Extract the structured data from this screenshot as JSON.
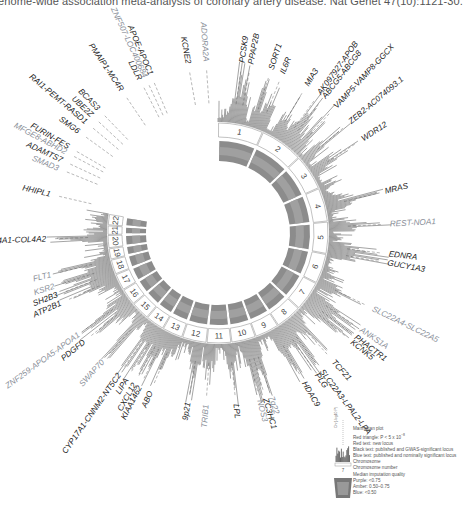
{
  "caption": "enome-wide association meta-analysis of coronary artery disease. Nat Genet 47(10):1121-30.",
  "colors": {
    "black_text": "#222222",
    "blue_text": "#8a8f99",
    "red_text": "#9a9a9a",
    "ring_gray": "#8c8c8c",
    "ring_inner": "#a0a0a0",
    "manhattan": "#333333"
  },
  "chart_data": {
    "type": "circular_manhattan",
    "center": [
      218,
      233
    ],
    "chromosomes": [
      "1",
      "2",
      "3",
      "4",
      "5",
      "6",
      "7",
      "8",
      "9",
      "10",
      "11",
      "12",
      "13",
      "14",
      "15",
      "16",
      "17",
      "18",
      "19",
      "20",
      "21",
      "22"
    ],
    "chromosome_spans_deg": [
      [
        0,
        24
      ],
      [
        24,
        47
      ],
      [
        47,
        66
      ],
      [
        66,
        84
      ],
      [
        84,
        101
      ],
      [
        101,
        117
      ],
      [
        117,
        133
      ],
      [
        133,
        147
      ],
      [
        147,
        160
      ],
      [
        160,
        173
      ],
      [
        173,
        186
      ],
      [
        186,
        199
      ],
      [
        199,
        210
      ],
      [
        210,
        220
      ],
      [
        220,
        230
      ],
      [
        230,
        239
      ],
      [
        239,
        248
      ],
      [
        248,
        256
      ],
      [
        256,
        262
      ],
      [
        262,
        269
      ],
      [
        269,
        274
      ],
      [
        274,
        280
      ]
    ],
    "loci": [
      {
        "label": "PCSK9",
        "angle": 8,
        "style": "black"
      },
      {
        "label": "PPAP2B",
        "angle": 11,
        "style": "black"
      },
      {
        "label": "SORT1",
        "angle": 18,
        "style": "black"
      },
      {
        "label": "IL6R",
        "angle": 22,
        "style": "black"
      },
      {
        "label": "MIA3",
        "angle": 31,
        "style": "black"
      },
      {
        "label": "AK097927-APOB",
        "angle": 36,
        "style": "black"
      },
      {
        "label": "ABCG5-ABCG8",
        "angle": 38,
        "style": "black"
      },
      {
        "label": "VAMP5-VAMP8-GGCX",
        "angle": 43,
        "style": "black"
      },
      {
        "label": "ZEB2-AC074093.1",
        "angle": 50,
        "style": "black"
      },
      {
        "label": "WDR12",
        "angle": 57,
        "style": "black"
      },
      {
        "label": "MRAS",
        "angle": 76,
        "style": "black"
      },
      {
        "label": "REST-NOA1",
        "angle": 87,
        "style": "blue"
      },
      {
        "label": "EDNRA",
        "angle": 97,
        "style": "black"
      },
      {
        "label": "GUCY1A3",
        "angle": 100,
        "style": "black"
      },
      {
        "label": "SLC22A4-SLC22A5",
        "angle": 116,
        "style": "blue"
      },
      {
        "label": "ANKS1A",
        "angle": 124,
        "style": "blue"
      },
      {
        "label": "PHACTR1",
        "angle": 127,
        "style": "black"
      },
      {
        "label": "KCNK5",
        "angle": 129,
        "style": "black"
      },
      {
        "label": "TCF21",
        "angle": 138,
        "style": "black"
      },
      {
        "label": "SLC22A3-LPAL2-LPA",
        "angle": 143,
        "style": "black"
      },
      {
        "label": "PLG",
        "angle": 145,
        "style": "black"
      },
      {
        "label": "HDAC9",
        "angle": 150,
        "style": "black"
      },
      {
        "label": "7q22",
        "angle": 162,
        "style": "blue"
      },
      {
        "label": "ZC3HC1",
        "angle": 164,
        "style": "black"
      },
      {
        "label": "NOS3",
        "angle": 166,
        "style": "blue"
      },
      {
        "label": "LPL",
        "angle": 174,
        "style": "black"
      },
      {
        "label": "TRIB1",
        "angle": 184,
        "style": "blue"
      },
      {
        "label": "9p21",
        "angle": 190,
        "style": "black"
      },
      {
        "label": "ABO",
        "angle": 203,
        "style": "black"
      },
      {
        "label": "KIAA1462",
        "angle": 207,
        "style": "black"
      },
      {
        "label": "CXCL12",
        "angle": 209,
        "style": "black"
      },
      {
        "label": "LIPA",
        "angle": 212,
        "style": "black"
      },
      {
        "label": "CYP17A1-CNNM2-NT5C2",
        "angle": 215,
        "style": "black"
      },
      {
        "label": "SWAP70",
        "angle": 222,
        "style": "blue"
      },
      {
        "label": "PDGFD",
        "angle": 231,
        "style": "black"
      },
      {
        "label": "ZNF259-APOA5-APOA1",
        "angle": 234,
        "style": "blue"
      },
      {
        "label": "ATP2B1",
        "angle": 246,
        "style": "black"
      },
      {
        "label": "SH2B3",
        "angle": 249,
        "style": "black"
      },
      {
        "label": "KSR2",
        "angle": 252,
        "style": "blue"
      },
      {
        "label": "FLT1",
        "angle": 256,
        "style": "blue"
      },
      {
        "label": "COL4A1-COL4A2",
        "angle": 268,
        "style": "black"
      },
      {
        "label": "HHIPL1",
        "angle": 283,
        "style": "black"
      },
      {
        "label": "SMAD3",
        "angle": 292,
        "style": "blue"
      },
      {
        "label": "ADAMTS7",
        "angle": 295,
        "style": "black"
      },
      {
        "label": "MFGE8-ABHD2",
        "angle": 298,
        "style": "blue"
      },
      {
        "label": "FURIN-FES",
        "angle": 300,
        "style": "black"
      },
      {
        "label": "SMG6",
        "angle": 306,
        "style": "black"
      },
      {
        "label": "RAI1-PEMT-RASD1",
        "angle": 310,
        "style": "black"
      },
      {
        "label": "UBE2Z",
        "angle": 313,
        "style": "black"
      },
      {
        "label": "BCAS3",
        "angle": 316,
        "style": "black"
      },
      {
        "label": "PMAIP1-MC4R",
        "angle": 326,
        "style": "black"
      },
      {
        "label": "LDLR",
        "angle": 333,
        "style": "black"
      },
      {
        "label": "ZNF507-LOC400684",
        "angle": 335,
        "style": "blue"
      },
      {
        "label": "APOE-APOC1",
        "angle": 337,
        "style": "black"
      },
      {
        "label": "KCNE2",
        "angle": 350,
        "style": "black"
      },
      {
        "label": "ADORA2A",
        "angle": 356,
        "style": "blue"
      }
    ],
    "legend": [
      "Manhattan plot",
      "Red triangle: P < 5 x 10^-8",
      "Red text: new locus",
      "Black text: published and GWAS-significant locus",
      "Blue text: published and nominally significant locus",
      "Chromosome",
      "Chromosome number",
      "Median imputation quality",
      "Purple: <0.75",
      "Amber: 0.50-0.75",
      "Blue: <0.50"
    ]
  },
  "legend": {
    "items": [
      "Manhattan plot",
      "Red triangle: P < 5 x 10",
      "Red text: new locus",
      "Black text: published and GWAS-significant locus",
      "Blue text: published and nominally significant locus",
      "Chromosome",
      "Chromosome number",
      "Median imputation quality",
      "Purple: <0.75",
      "Amber: 0.50–0.75",
      "Blue: <0.50"
    ],
    "exponent": "−8",
    "side_label": "Chr(-log10 P)"
  }
}
